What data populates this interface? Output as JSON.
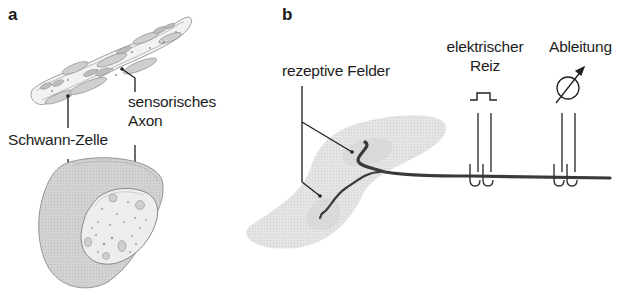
{
  "panel_a": {
    "letter": "a",
    "labels": {
      "sensory_axon_line1": "sensorisches",
      "sensory_axon_line2": "Axon",
      "schwann_cell": "Schwann-Zelle"
    }
  },
  "panel_b": {
    "letter": "b",
    "labels": {
      "receptive_fields": "rezeptive Felder",
      "electrical_stimulus_line1": "elektrischer",
      "electrical_stimulus_line2": "Reiz",
      "recording": "Ableitung"
    },
    "icons": {
      "stimulus": "square-pulse-icon",
      "recording": "meter-dial-icon"
    }
  },
  "colors": {
    "line": "#1e1e1e",
    "cell_fill": "#d4d4d4",
    "axon_fill": "#ececec",
    "skin_fill": "#e2e2e2",
    "nerve": "#3a3a3a"
  }
}
